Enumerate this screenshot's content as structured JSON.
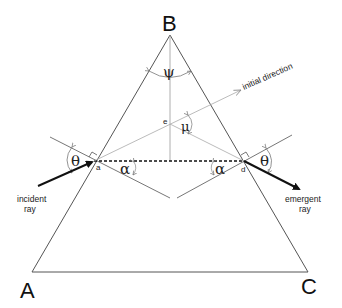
{
  "diagram": {
    "vertices": {
      "B": {
        "label": "B"
      },
      "A": {
        "label": "A"
      },
      "C": {
        "label": "C"
      }
    },
    "points": {
      "a": {
        "label": "a"
      },
      "d": {
        "label": "d"
      },
      "e": {
        "label": "e"
      }
    },
    "angles": {
      "apex": {
        "symbol": "ψ"
      },
      "deviation": {
        "symbol": "μ"
      },
      "incidence": {
        "symbol": "θ"
      },
      "emergence": {
        "symbol": "θ"
      },
      "refraction_left": {
        "symbol": "α"
      },
      "refraction_right": {
        "symbol": "α"
      }
    },
    "rays": {
      "incident": {
        "line1": "incident",
        "line2": "ray"
      },
      "emergent": {
        "line1": "emergent",
        "line2": "ray"
      },
      "initial_direction": {
        "label": "initial direction"
      }
    },
    "colors": {
      "prism_edge": "#555555",
      "ray": "#111111",
      "construction": "#9a9a9a",
      "text": "#111111"
    }
  }
}
